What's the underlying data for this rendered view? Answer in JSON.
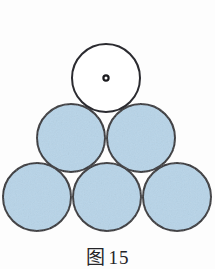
{
  "page": {
    "background_color": "#fdfdfd",
    "width": 215,
    "height": 269
  },
  "caption_top": {
    "label": "图",
    "number": "14",
    "full_text": "图 14"
  },
  "caption_bottom": {
    "label": "图",
    "number": "15",
    "full_text": "图 15",
    "note_clipped": "true"
  },
  "diagram": {
    "name": "circle-pyramid-packing",
    "circle_count": 6,
    "radius": 35,
    "stroke_color": "#2b2b30",
    "stroke_width": 2,
    "fill_color": "#b7d4e8",
    "empty_fill_color": "#ffffff",
    "center_dot_color": "#1b1b1f",
    "center_dot_radius": 2.6,
    "rows": [
      {
        "name": "top-row",
        "count": 1,
        "circles": [
          {
            "id": "circle-top",
            "cx": 106,
            "cy": 78,
            "r": 35,
            "filled": "false",
            "center_dot": "true"
          }
        ]
      },
      {
        "name": "middle-row",
        "count": 2,
        "circles": [
          {
            "id": "circle-middle-left",
            "cx": 71,
            "cy": 138,
            "r": 35,
            "filled": "true",
            "center_dot": "false"
          },
          {
            "id": "circle-middle-right",
            "cx": 141,
            "cy": 138,
            "r": 35,
            "filled": "true",
            "center_dot": "false"
          }
        ]
      },
      {
        "name": "bottom-row",
        "count": 3,
        "circles": [
          {
            "id": "circle-bottom-left",
            "cx": 37,
            "cy": 197,
            "r": 35,
            "filled": "true",
            "center_dot": "false"
          },
          {
            "id": "circle-bottom-center",
            "cx": 107,
            "cy": 197,
            "r": 35,
            "filled": "true",
            "center_dot": "false"
          },
          {
            "id": "circle-bottom-right",
            "cx": 177,
            "cy": 197,
            "r": 35,
            "filled": "true",
            "center_dot": "false"
          }
        ]
      }
    ]
  }
}
